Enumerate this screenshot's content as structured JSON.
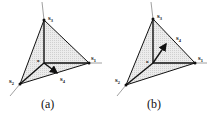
{
  "figure": {
    "panels": [
      {
        "caption": "(a)",
        "origin_label": "o",
        "vectors": [
          {
            "name": "s",
            "sub": "1"
          },
          {
            "name": "s",
            "sub": "2"
          },
          {
            "name": "s",
            "sub": "3"
          },
          {
            "name": "s",
            "sub": "4"
          }
        ],
        "s4_direction": "in-plane, toward lower right between s1 and s2"
      },
      {
        "caption": "(b)",
        "origin_label": "o",
        "vectors": [
          {
            "name": "s",
            "sub": "1"
          },
          {
            "name": "s",
            "sub": "2"
          },
          {
            "name": "s",
            "sub": "3"
          },
          {
            "name": "s",
            "sub": "4"
          }
        ],
        "s4_direction": "toward upper right, out of s1-s2 plane"
      }
    ],
    "colors": {
      "fill": "#e4e4e4",
      "line": "#111111",
      "axis": "#888888"
    }
  }
}
